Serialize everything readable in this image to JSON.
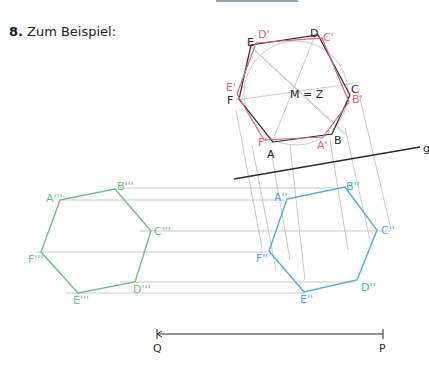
{
  "heading": {
    "number": "8.",
    "text": "Zum Beispiel:"
  },
  "colors": {
    "black": "#2a2a2a",
    "red": "#e0607a",
    "blue": "#4aaee0",
    "green": "#6fbf8a",
    "guide": "#b8b8b8"
  },
  "labels": {
    "top_black": {
      "A": "A",
      "B": "B",
      "C": "C",
      "D": "D",
      "E": "E",
      "F": "F"
    },
    "top_red": {
      "A": "A'",
      "B": "B'",
      "C": "C'",
      "D": "D'",
      "E": "E'",
      "F": "F'"
    },
    "center": "M = Z",
    "axis": "g",
    "blue": {
      "A": "A''",
      "B": "B''",
      "C": "C''",
      "D": "D''",
      "E": "E''",
      "F": "F''"
    },
    "green": {
      "A": "A'''",
      "B": "B'''",
      "C": "C'''",
      "D": "D'''",
      "E": "E'''",
      "F": "F'''"
    },
    "segment": {
      "Q": "Q",
      "P": "P"
    }
  }
}
